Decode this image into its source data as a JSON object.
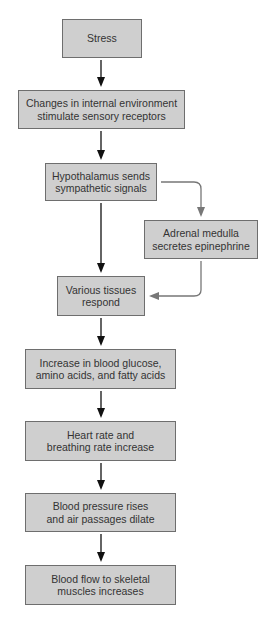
{
  "diagram": {
    "type": "flowchart",
    "nodes": [
      {
        "id": "stress",
        "label": "Stress"
      },
      {
        "id": "changes",
        "label": "Changes in internal environment\nstimulate sensory receptors"
      },
      {
        "id": "hypothalamus",
        "label": "Hypothalamus sends\nsympathetic signals"
      },
      {
        "id": "adrenal",
        "label": "Adrenal medulla\nsecretes epinephrine"
      },
      {
        "id": "tissues",
        "label": "Various tissues\nrespond"
      },
      {
        "id": "increase",
        "label": "Increase in blood glucose,\namino acids, and fatty acids"
      },
      {
        "id": "heart",
        "label": "Heart rate and\nbreathing rate increase"
      },
      {
        "id": "pressure",
        "label": "Blood pressure rises\nand air passages dilate"
      },
      {
        "id": "flow",
        "label": "Blood flow to skeletal\nmuscles increases"
      }
    ],
    "edges": [
      {
        "from": "stress",
        "to": "changes",
        "color": "#111111"
      },
      {
        "from": "changes",
        "to": "hypothalamus",
        "color": "#111111"
      },
      {
        "from": "hypothalamus",
        "to": "tissues",
        "color": "#111111"
      },
      {
        "from": "hypothalamus",
        "to": "adrenal",
        "color": "#777777"
      },
      {
        "from": "adrenal",
        "to": "tissues",
        "color": "#777777"
      },
      {
        "from": "tissues",
        "to": "increase",
        "color": "#111111"
      },
      {
        "from": "increase",
        "to": "heart",
        "color": "#111111"
      },
      {
        "from": "heart",
        "to": "pressure",
        "color": "#111111"
      },
      {
        "from": "pressure",
        "to": "flow",
        "color": "#111111"
      }
    ],
    "colors": {
      "box_fill": "#cfcfcf",
      "box_border": "#6e6e6e",
      "text": "#333333",
      "main_arrow": "#111111",
      "side_arrow": "#777777"
    }
  }
}
